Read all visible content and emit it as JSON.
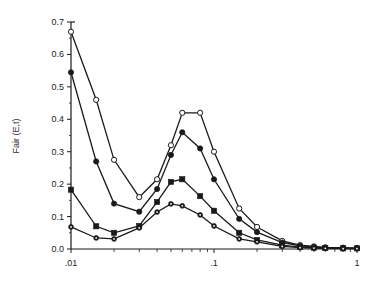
{
  "chart_data": {
    "type": "line",
    "title": "",
    "xlabel": "",
    "ylabel": "Fair (E,t)",
    "xscale": "log",
    "xlim": [
      0.01,
      1
    ],
    "ylim": [
      0,
      0.7
    ],
    "grid": false,
    "legend": "none",
    "x_tick_labels": [
      ".01",
      ".1",
      "1"
    ],
    "x_ticks": [
      0.01,
      0.1,
      1
    ],
    "y_tick_labels": [
      "0.0",
      "0.1",
      "0.2",
      "0.3",
      "0.4",
      "0.5",
      "0.6",
      "0.7"
    ],
    "y_ticks": [
      0,
      0.1,
      0.2,
      0.3,
      0.4,
      0.5,
      0.6,
      0.7
    ],
    "x": [
      0.01,
      0.015,
      0.02,
      0.03,
      0.04,
      0.05,
      0.06,
      0.08,
      0.1,
      0.15,
      0.2,
      0.3,
      0.4,
      0.5,
      0.6,
      0.8,
      1.0
    ],
    "series": [
      {
        "name": "open-circle",
        "marker": "open-circle",
        "values": [
          0.67,
          0.46,
          0.275,
          0.16,
          0.215,
          0.32,
          0.42,
          0.42,
          0.3,
          0.125,
          0.068,
          0.025,
          0.012,
          0.008,
          0.005,
          0.004,
          0.003
        ]
      },
      {
        "name": "filled-circle",
        "marker": "filled-circle",
        "values": [
          0.545,
          0.27,
          0.14,
          0.115,
          0.185,
          0.29,
          0.36,
          0.31,
          0.215,
          0.093,
          0.052,
          0.02,
          0.01,
          0.006,
          0.004,
          0.003,
          0.002
        ]
      },
      {
        "name": "filled-square",
        "marker": "filled-square",
        "values": [
          0.183,
          0.07,
          0.05,
          0.071,
          0.145,
          0.207,
          0.215,
          0.163,
          0.118,
          0.05,
          0.028,
          0.012,
          0.006,
          0.004,
          0.003,
          0.002,
          0.002
        ]
      },
      {
        "name": "dotted-circle",
        "marker": "dotted-circle",
        "values": [
          0.068,
          0.034,
          0.031,
          0.065,
          0.114,
          0.139,
          0.133,
          0.105,
          0.071,
          0.031,
          0.022,
          0.008,
          0.004,
          0.003,
          0.002,
          0.001,
          0.001
        ]
      }
    ]
  },
  "colors": {
    "line": "#1a1a1a",
    "axis": "#1a1a1a",
    "background": "#ffffff"
  }
}
